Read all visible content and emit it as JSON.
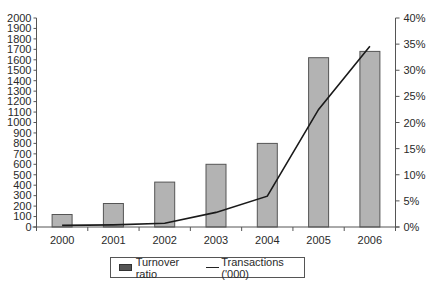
{
  "chart_data": {
    "type": "bar",
    "title": "",
    "xlabel": "",
    "ylabel": "",
    "y2label": "",
    "categories": [
      "2000",
      "2001",
      "2002",
      "2003",
      "2004",
      "2005",
      "2006"
    ],
    "series": [
      {
        "name": "Turnover ratio",
        "type": "bar",
        "axis": "left",
        "values": [
          120,
          225,
          430,
          600,
          800,
          1620,
          1680
        ],
        "color": "#b3b3b3"
      },
      {
        "name": "Transactions ('000)",
        "type": "line",
        "axis": "right",
        "values": [
          0.3,
          0.4,
          0.7,
          2.8,
          5.9,
          22.5,
          34.6
        ],
        "color": "#1a1a1a"
      }
    ],
    "ylim": [
      0,
      2000
    ],
    "y_ticks": [
      "0",
      "100",
      "200",
      "300",
      "400",
      "500",
      "600",
      "700",
      "800",
      "900",
      "1000",
      "1100",
      "1200",
      "1300",
      "1400",
      "1500",
      "1600",
      "1700",
      "1800",
      "1900",
      "2000"
    ],
    "y2lim": [
      0,
      40
    ],
    "y2_ticks": [
      "0%",
      "5%",
      "10%",
      "15%",
      "20%",
      "25%",
      "30%",
      "35%",
      "40%"
    ],
    "grid": false,
    "legend_position": "bottom-center"
  },
  "legend": {
    "bar_label": "Turnover ratio",
    "line_label": "Transactions ('000)"
  }
}
